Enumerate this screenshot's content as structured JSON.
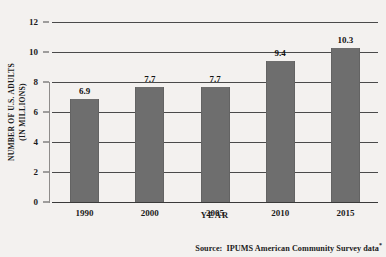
{
  "chart_data": {
    "type": "bar",
    "title": "",
    "xlabel": "YEAR",
    "ylabel": "NUMBER OF U.S. ADULTS\n(IN MILLIONS)",
    "ylabel_line1": "NUMBER OF U.S. ADULTS",
    "ylabel_line2": "(IN MILLIONS)",
    "categories": [
      "1990",
      "2000",
      "2005",
      "2010",
      "2015"
    ],
    "values": [
      6.9,
      7.7,
      7.7,
      9.4,
      10.3
    ],
    "value_labels": [
      "6.9",
      "7.7",
      "7.7",
      "9.4",
      "10.3"
    ],
    "ylim": [
      0,
      12
    ],
    "yticks": [
      0,
      2,
      4,
      6,
      8,
      10,
      12
    ],
    "ytick_labels": [
      "0",
      "2",
      "4",
      "6",
      "8",
      "10",
      "12"
    ],
    "grid": true,
    "grid_axis": "y",
    "legend": null,
    "bar_color": "#6e6e6e",
    "background_color": "#f3f1ef",
    "gridline_color": "#4a4a4a",
    "text_color": "#1b1b1b"
  },
  "source": {
    "prefix": "Source:",
    "text": "IPUMS American Community Survey data",
    "footnote_marker": "*",
    "full": "Source:  IPUMS American Community Survey data*"
  }
}
